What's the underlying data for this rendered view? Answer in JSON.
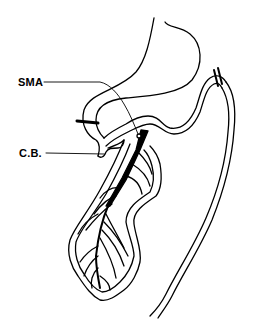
{
  "diagram": {
    "labels": {
      "sma": "SMA",
      "cb": "C.B."
    },
    "colors": {
      "stroke": "#000000",
      "background": "#ffffff"
    }
  }
}
